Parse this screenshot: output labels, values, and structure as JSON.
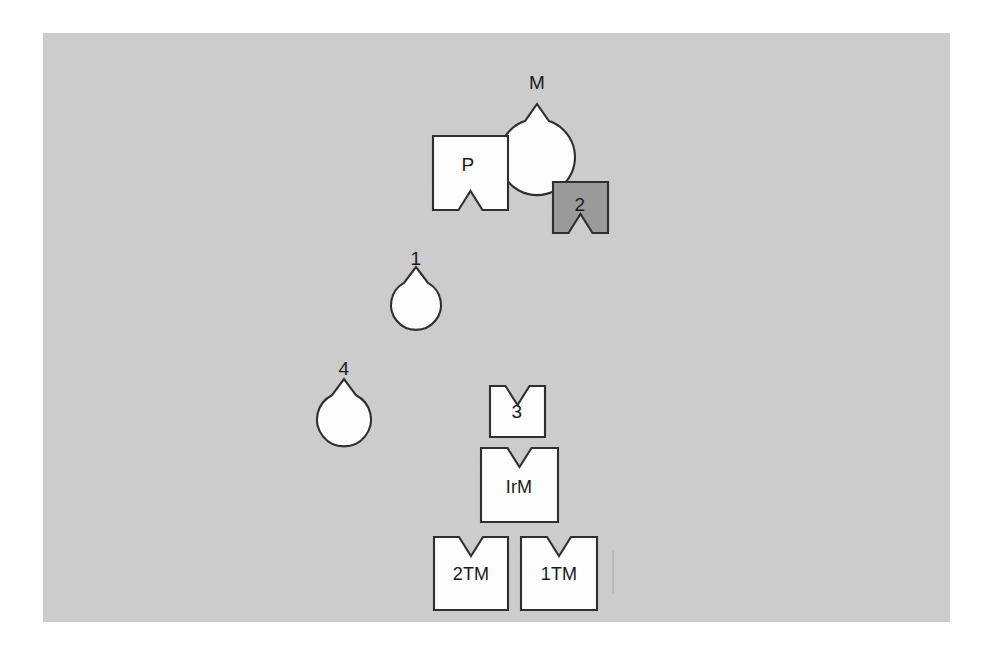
{
  "figure": {
    "canvas": {
      "name": "gray-plate",
      "x": 43,
      "y": 33,
      "width": 907,
      "height": 589,
      "background_color": "#cccccc",
      "page_background_color": "#ffffff"
    },
    "colors": {
      "shape_light_fill": "#fdfdfd",
      "shape_dark_fill": "#9a9a9a",
      "shape_outline": "#2f2f2f",
      "label_text": "#1a1a1a"
    },
    "notch": {
      "shape": "v-cut",
      "width": 24,
      "depth": 19
    },
    "shapes": [
      {
        "id": "shape-m",
        "label": "M",
        "form": "circle",
        "notch_side": "bottom",
        "fill": "light",
        "cx": 537,
        "cy": 85,
        "r": 38,
        "label_x": 537,
        "label_y": 84
      },
      {
        "id": "shape-p",
        "label": "P",
        "form": "rect",
        "notch_side": "bottom",
        "fill": "light",
        "x": 433,
        "y": 136,
        "width": 75,
        "height": 74,
        "label_x": 468,
        "label_y": 166
      },
      {
        "id": "shape-2",
        "label": "2",
        "form": "rect",
        "notch_side": "bottom",
        "fill": "dark",
        "x": 553,
        "y": 182,
        "width": 55,
        "height": 51,
        "label_x": 580,
        "label_y": 206
      },
      {
        "id": "shape-1",
        "label": "1",
        "form": "circle",
        "notch_side": "bottom",
        "fill": "light",
        "cx": 416,
        "cy": 261,
        "r": 25,
        "label_x": 416,
        "label_y": 260
      },
      {
        "id": "shape-4",
        "label": "4",
        "form": "circle",
        "notch_side": "bottom",
        "fill": "light",
        "cx": 344,
        "cy": 371,
        "r": 27,
        "label_x": 344,
        "label_y": 370
      },
      {
        "id": "shape-3",
        "label": "3",
        "form": "rect",
        "notch_side": "top",
        "fill": "light",
        "x": 490,
        "y": 386,
        "width": 55,
        "height": 51,
        "label_x": 517,
        "label_y": 413
      },
      {
        "id": "shape-irm",
        "label": "IrM",
        "form": "rect",
        "notch_side": "top",
        "fill": "light",
        "x": 481,
        "y": 448,
        "width": 77,
        "height": 74,
        "label_x": 519,
        "label_y": 488
      },
      {
        "id": "shape-2tm",
        "label": "2TM",
        "form": "rect",
        "notch_side": "top",
        "fill": "light",
        "x": 434,
        "y": 537,
        "width": 74,
        "height": 73,
        "label_x": 471,
        "label_y": 575
      },
      {
        "id": "shape-1tm",
        "label": "1TM",
        "form": "rect",
        "notch_side": "top",
        "fill": "light",
        "x": 521,
        "y": 537,
        "width": 76,
        "height": 73,
        "label_x": 559,
        "label_y": 575
      }
    ],
    "artifacts": [
      {
        "id": "scan-line",
        "x": 612,
        "y": 551,
        "width": 2,
        "height": 42
      }
    ]
  }
}
